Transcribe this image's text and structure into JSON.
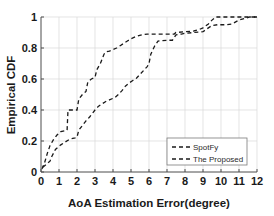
{
  "chart_data": {
    "type": "line",
    "title": "",
    "xlabel": "AoA Estimation Error(degree)",
    "ylabel": "Empirical CDF",
    "xlim": [
      0,
      12
    ],
    "ylim": [
      0,
      1
    ],
    "xticks": [
      "0",
      "1",
      "2",
      "3",
      "4",
      "5",
      "6",
      "7",
      "8",
      "9",
      "10",
      "11",
      "12"
    ],
    "xtick_values": [
      0,
      1,
      2,
      3,
      4,
      5,
      6,
      7,
      8,
      9,
      10,
      11,
      12
    ],
    "yticks": [
      "0",
      "0.2",
      "0.4",
      "0.6",
      "0.8",
      "1"
    ],
    "ytick_values": [
      0,
      0.2,
      0.4,
      0.6,
      0.8,
      1
    ],
    "grid": true,
    "legend_position": "lower right",
    "line_color": "#1a1a1a",
    "grid_color": "#d8d8d8",
    "axis_color": "#4d4d4d",
    "series": [
      {
        "name": "SpotFy",
        "style": "dashed",
        "x": [
          0.05,
          0.2,
          0.35,
          0.5,
          0.7,
          0.9,
          1.1,
          1.3,
          1.45,
          1.5,
          1.75,
          2.0,
          2.1,
          2.3,
          2.5,
          2.6,
          2.8,
          3.0,
          3.1,
          3.3,
          3.5,
          3.6,
          3.8,
          4.0,
          4.2,
          4.4,
          4.6,
          4.8,
          5.0,
          5.3,
          5.6,
          5.9,
          6.0,
          6.5,
          7.0,
          7.4,
          7.5,
          8.0,
          8.5,
          8.8,
          9.0,
          9.3,
          9.5,
          9.7,
          9.9,
          10.5,
          11.0,
          11.5,
          12.0
        ],
        "y": [
          0.02,
          0.06,
          0.12,
          0.17,
          0.21,
          0.24,
          0.26,
          0.265,
          0.27,
          0.4,
          0.4,
          0.4,
          0.47,
          0.5,
          0.52,
          0.58,
          0.6,
          0.61,
          0.66,
          0.7,
          0.76,
          0.775,
          0.78,
          0.79,
          0.8,
          0.815,
          0.83,
          0.845,
          0.86,
          0.875,
          0.885,
          0.89,
          0.89,
          0.89,
          0.89,
          0.89,
          0.9,
          0.905,
          0.91,
          0.92,
          0.93,
          0.955,
          0.98,
          1.0,
          1.0,
          1.0,
          1.0,
          1.0,
          1.0
        ]
      },
      {
        "name": "The Proposed",
        "style": "dashed",
        "x": [
          0.1,
          0.3,
          0.5,
          0.6,
          0.8,
          0.95,
          1.1,
          1.3,
          1.5,
          1.7,
          1.9,
          2.0,
          2.1,
          2.3,
          2.5,
          2.7,
          2.9,
          3.0,
          3.2,
          3.4,
          3.6,
          3.8,
          4.0,
          4.1,
          4.3,
          4.5,
          4.7,
          4.9,
          5.1,
          5.3,
          5.5,
          5.7,
          5.9,
          6.0,
          6.1,
          6.3,
          6.5,
          7.0,
          7.3,
          7.5,
          7.8,
          8.0,
          8.5,
          9.0,
          9.3,
          9.5,
          9.8,
          10.0,
          10.3,
          10.6,
          11.0,
          11.3,
          11.6,
          12.0
        ],
        "y": [
          0.03,
          0.05,
          0.07,
          0.1,
          0.145,
          0.16,
          0.175,
          0.19,
          0.205,
          0.215,
          0.22,
          0.225,
          0.27,
          0.3,
          0.33,
          0.355,
          0.385,
          0.4,
          0.425,
          0.44,
          0.455,
          0.465,
          0.475,
          0.48,
          0.5,
          0.525,
          0.555,
          0.575,
          0.59,
          0.605,
          0.63,
          0.655,
          0.68,
          0.7,
          0.76,
          0.81,
          0.845,
          0.85,
          0.85,
          0.885,
          0.89,
          0.895,
          0.9,
          0.905,
          0.93,
          0.945,
          0.95,
          0.95,
          0.95,
          0.955,
          0.98,
          0.99,
          1.0,
          1.0
        ]
      }
    ]
  },
  "legend": {
    "entries": [
      {
        "label": "SpotFy"
      },
      {
        "label": "The Proposed"
      }
    ]
  },
  "axes": {
    "x_title": "AoA Estimation Error(degree)",
    "y_title": "Empirical CDF"
  }
}
